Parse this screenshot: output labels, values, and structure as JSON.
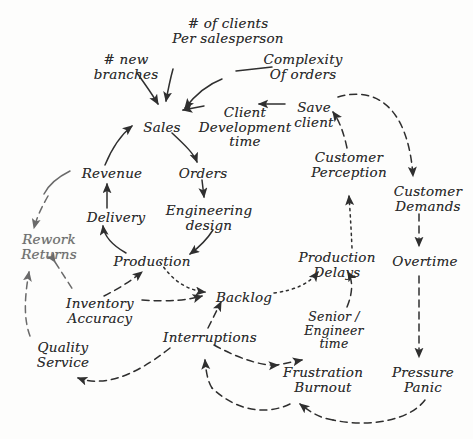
{
  "diagram": {
    "type": "causal-loop-diagram",
    "canvas": {
      "width": 473,
      "height": 439,
      "background": "#fdfdfc"
    },
    "ink_color": "#2b2b2b",
    "faint_ink_color": "#6e6e6e",
    "nodes": [
      {
        "id": "clients-per-salesperson",
        "label": "# of clients\nPer salesperson",
        "x": 168,
        "y": 16,
        "w": 120,
        "tone": "normal",
        "size": "normal"
      },
      {
        "id": "new-branches",
        "label": "# new\nbranches",
        "x": 88,
        "y": 52,
        "w": 76,
        "tone": "normal",
        "size": "normal"
      },
      {
        "id": "complexity-of-orders",
        "label": "Complexity\nOf orders",
        "x": 258,
        "y": 52,
        "w": 90,
        "tone": "normal",
        "size": "normal"
      },
      {
        "id": "sales",
        "label": "Sales",
        "x": 140,
        "y": 120,
        "w": 44,
        "tone": "normal",
        "size": "normal"
      },
      {
        "id": "client-development-time",
        "label": "Client\nDevelopment\ntime",
        "x": 197,
        "y": 105,
        "w": 96,
        "tone": "normal",
        "size": "normal"
      },
      {
        "id": "save-client",
        "label": "Save\nclient",
        "x": 289,
        "y": 100,
        "w": 50,
        "tone": "normal",
        "size": "normal"
      },
      {
        "id": "revenue",
        "label": "Revenue",
        "x": 78,
        "y": 166,
        "w": 68,
        "tone": "normal",
        "size": "normal"
      },
      {
        "id": "orders",
        "label": "Orders",
        "x": 175,
        "y": 166,
        "w": 56,
        "tone": "normal",
        "size": "normal"
      },
      {
        "id": "customer-perception",
        "label": "Customer\nPerception",
        "x": 305,
        "y": 150,
        "w": 88,
        "tone": "normal",
        "size": "normal"
      },
      {
        "id": "customer-demands",
        "label": "Customer\nDemands",
        "x": 388,
        "y": 184,
        "w": 80,
        "tone": "normal",
        "size": "normal"
      },
      {
        "id": "delivery",
        "label": "Delivery",
        "x": 84,
        "y": 210,
        "w": 64,
        "tone": "normal",
        "size": "normal"
      },
      {
        "id": "engineering-design",
        "label": "Engineering\ndesign",
        "x": 163,
        "y": 203,
        "w": 92,
        "tone": "normal",
        "size": "normal"
      },
      {
        "id": "rework-returns",
        "label": "Rework\nReturns",
        "x": 16,
        "y": 232,
        "w": 66,
        "tone": "faint",
        "size": "normal"
      },
      {
        "id": "production",
        "label": "Production",
        "x": 110,
        "y": 254,
        "w": 84,
        "tone": "normal",
        "size": "normal"
      },
      {
        "id": "production-delays",
        "label": "Production\nDelays",
        "x": 295,
        "y": 250,
        "w": 84,
        "tone": "normal",
        "size": "normal"
      },
      {
        "id": "overtime",
        "label": "Overtime",
        "x": 388,
        "y": 254,
        "w": 74,
        "tone": "normal",
        "size": "normal"
      },
      {
        "id": "backlog",
        "label": "Backlog",
        "x": 212,
        "y": 290,
        "w": 64,
        "tone": "normal",
        "size": "normal"
      },
      {
        "id": "inventory-accuracy",
        "label": "Inventory\nAccuracy",
        "x": 62,
        "y": 296,
        "w": 76,
        "tone": "normal",
        "size": "normal"
      },
      {
        "id": "senior-engineer-time",
        "label": "Senior /\nEngineer\ntime",
        "x": 303,
        "y": 310,
        "w": 62,
        "tone": "normal",
        "size": "small"
      },
      {
        "id": "interruptions",
        "label": "Interruptions",
        "x": 162,
        "y": 330,
        "w": 96,
        "tone": "normal",
        "size": "normal"
      },
      {
        "id": "quality-service",
        "label": "Quality\nService",
        "x": 32,
        "y": 340,
        "w": 62,
        "tone": "normal",
        "size": "normal"
      },
      {
        "id": "frustration-burnout",
        "label": "Frustration\nBurnout",
        "x": 280,
        "y": 365,
        "w": 86,
        "tone": "normal",
        "size": "normal"
      },
      {
        "id": "pressure-panic",
        "label": "Pressure\nPanic",
        "x": 387,
        "y": 365,
        "w": 72,
        "tone": "normal",
        "size": "normal"
      }
    ],
    "links": [
      {
        "from": "new-branches",
        "to": "sales",
        "style": "solid"
      },
      {
        "from": "clients-per-salesperson",
        "to": "sales",
        "style": "solid"
      },
      {
        "from": "complexity-of-orders",
        "to": "sales",
        "style": "solid"
      },
      {
        "from": "save-client",
        "to": "client-development-time",
        "style": "solid"
      },
      {
        "from": "client-development-time",
        "to": "sales",
        "style": "solid"
      },
      {
        "from": "sales",
        "to": "orders",
        "style": "solid"
      },
      {
        "from": "orders",
        "to": "engineering-design",
        "style": "solid"
      },
      {
        "from": "engineering-design",
        "to": "production",
        "style": "solid"
      },
      {
        "from": "production",
        "to": "delivery",
        "style": "solid"
      },
      {
        "from": "delivery",
        "to": "revenue",
        "style": "solid"
      },
      {
        "from": "revenue",
        "to": "sales",
        "style": "solid"
      },
      {
        "from": "production",
        "to": "backlog",
        "style": "dotted"
      },
      {
        "from": "backlog",
        "to": "production-delays",
        "style": "dotted"
      },
      {
        "from": "production-delays",
        "to": "customer-perception",
        "style": "dotted"
      },
      {
        "from": "customer-perception",
        "to": "save-client",
        "style": "dashed"
      },
      {
        "from": "save-client",
        "to": "customer-demands",
        "style": "dashed"
      },
      {
        "from": "customer-demands",
        "to": "overtime",
        "style": "dashed"
      },
      {
        "from": "overtime",
        "to": "pressure-panic",
        "style": "dashed"
      },
      {
        "from": "pressure-panic",
        "to": "frustration-burnout",
        "style": "dashed"
      },
      {
        "from": "frustration-burnout",
        "to": "senior-engineer-time",
        "style": "dashed"
      },
      {
        "from": "senior-engineer-time",
        "to": "production-delays",
        "style": "dashed"
      },
      {
        "from": "interruptions",
        "to": "backlog",
        "style": "dashed"
      },
      {
        "from": "interruptions",
        "to": "frustration-burnout",
        "style": "dashed"
      },
      {
        "from": "frustration-burnout",
        "to": "interruptions",
        "style": "dashed"
      },
      {
        "from": "inventory-accuracy",
        "to": "backlog",
        "style": "dashed"
      },
      {
        "from": "inventory-accuracy",
        "to": "production",
        "style": "dashed"
      },
      {
        "from": "inventory-accuracy",
        "to": "rework-returns",
        "style": "dashed"
      },
      {
        "from": "quality-service",
        "to": "rework-returns",
        "style": "dashed"
      },
      {
        "from": "interruptions",
        "to": "quality-service",
        "style": "dashed"
      },
      {
        "from": "revenue-loop",
        "to": "rework-returns",
        "style": "dashed"
      }
    ]
  }
}
